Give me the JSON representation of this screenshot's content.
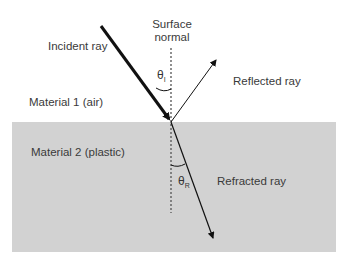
{
  "diagram": {
    "labels": {
      "surface_normal_line1": "Surface",
      "surface_normal_line2": "normal",
      "incident_ray": "Incident ray",
      "reflected_ray": "Reflected ray",
      "material_1": "Material 1 (air)",
      "material_2": "Material 2 (plastic)",
      "refracted_ray": "Refracted ray",
      "theta_incident_symbol": "θ",
      "theta_incident_sub": "I",
      "theta_refracted_symbol": "θ",
      "theta_refracted_sub": "R"
    },
    "colors": {
      "background": "#ffffff",
      "material_2_fill": "#d2d2d2",
      "lines": "#111111",
      "text": "#3a3a3a"
    }
  }
}
